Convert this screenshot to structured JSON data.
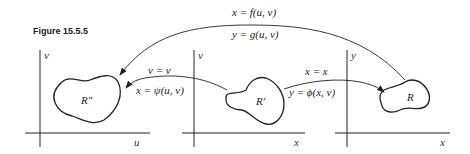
{
  "figure": {
    "title": "Figure 15.5.5"
  },
  "panels": [
    {
      "name": "uv-plane",
      "region_label": "R″",
      "x_axis": "u",
      "y_axis": "v"
    },
    {
      "name": "xv-plane",
      "region_label": "R′",
      "x_axis": "x",
      "y_axis": "v"
    },
    {
      "name": "xy-plane",
      "region_label": "R",
      "x_axis": "x",
      "y_axis": "y"
    }
  ],
  "mappings": {
    "top": {
      "line1": "x = f(u, v)",
      "line2": "y = g(u, v)"
    },
    "middle_left": {
      "line1": "v = v",
      "line2": "x = ψ(u, v)"
    },
    "middle_right": {
      "line1": "x = x",
      "line2": "y = ϕ(x, v)"
    }
  }
}
